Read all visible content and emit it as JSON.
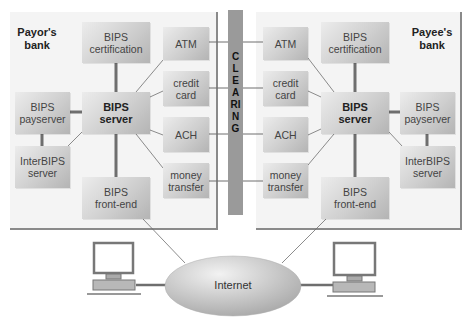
{
  "diagram": {
    "payor_bank": {
      "label": "Payor's\nbank",
      "nodes": {
        "certification": "BIPS\ncertification",
        "server": "BIPS\nserver",
        "payserver": "BIPS\npayserver",
        "interbips": "InterBIPS\nserver",
        "frontend": "BIPS\nfront-end",
        "atm": "ATM",
        "credit_card": "credit\ncard",
        "ach": "ACH",
        "money_transfer": "money\ntransfer"
      }
    },
    "payee_bank": {
      "label": "Payee's\nbank",
      "nodes": {
        "certification": "BIPS\ncertification",
        "server": "BIPS\nserver",
        "payserver": "BIPS\npayserver",
        "interbips": "InterBIPS\nserver",
        "frontend": "BIPS\nfront-end",
        "atm": "ATM",
        "credit_card": "credit\ncard",
        "ach": "ACH",
        "money_transfer": "money\ntransfer"
      }
    },
    "clearing": "CLEARING",
    "internet": "Internet",
    "clients": [
      "computer-icon",
      "computer-icon"
    ],
    "colors": {
      "panel_bg": "#f4f4f4",
      "box_light": "#ececec",
      "box_dark": "#b4b4b4",
      "clearing_bar": "#9a9a9a",
      "connector": "#6e6e6e"
    }
  }
}
